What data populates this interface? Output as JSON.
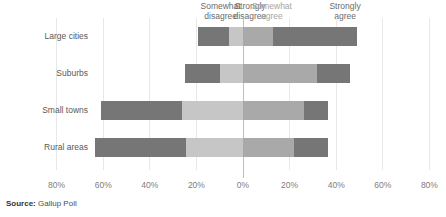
{
  "chart_data": {
    "type": "bar",
    "subtype": "diverging-stacked-bar",
    "title": "",
    "xlabel": "",
    "ylabel": "",
    "categories": [
      "Large cities",
      "Suburbs",
      "Small towns",
      "Rural areas"
    ],
    "series": [
      {
        "name": "Somewhat disagree",
        "color": "#767676",
        "side": "negative",
        "values": [
          -13.3,
          -14.9,
          -34.8,
          -39.1
        ]
      },
      {
        "name": "Strongly disagree",
        "color": "#c6c6c6",
        "side": "negative",
        "values": [
          -6.0,
          -10.0,
          -26.2,
          -24.5
        ]
      },
      {
        "name": "Somewhat agree",
        "color": "#a9a9a9",
        "side": "positive",
        "values": [
          12.9,
          31.8,
          26.2,
          21.9
        ]
      },
      {
        "name": "Strongly agree",
        "color": "#767676",
        "side": "positive",
        "values": [
          36.1,
          14.2,
          10.3,
          14.6
        ]
      }
    ],
    "xticks": [
      -80,
      -60,
      -40,
      -20,
      0,
      20,
      40,
      60,
      80
    ],
    "xticklabels": [
      "80%",
      "60%",
      "40%",
      "20%",
      "0%",
      "20%",
      "40%",
      "60%",
      "80%"
    ],
    "xlim": [
      -90,
      90
    ],
    "grid": true,
    "legend_position": "top",
    "zero_line": true
  },
  "legend": {
    "items": [
      {
        "label": "Somewhat\ndisagree",
        "center_pct": -9.6,
        "tone": "dark"
      },
      {
        "label": "Strongly\ndisagree",
        "center_pct": 3.0,
        "tone": "dark"
      },
      {
        "label": "Somewhat\nagree",
        "center_pct": 12.4,
        "tone": "light"
      },
      {
        "label": "Strongly\nagree",
        "center_pct": 43.8,
        "tone": "dark"
      }
    ]
  },
  "source": {
    "prefix": "Source:",
    "text": " Gallup Poll"
  },
  "colors": {
    "strongly_disagree": "#c6c6c6",
    "somewhat_disagree": "#767676",
    "somewhat_agree": "#a9a9a9",
    "strongly_agree": "#767676",
    "gridline": "#e8e8e8",
    "zeroline": "#bdbdbd",
    "text": "#595959"
  }
}
